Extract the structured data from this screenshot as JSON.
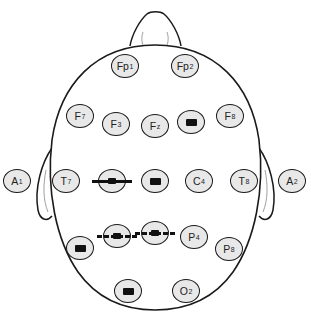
{
  "diagram": {
    "type": "eeg-10-20-electrode-map",
    "colors": {
      "outline": "#1a1a1a",
      "electrode_fill": "#e8e8e8",
      "redaction": "#111111"
    },
    "electrodes": [
      {
        "id": "Fp1",
        "base": "Fp",
        "sub": "1",
        "x": 125,
        "y": 66,
        "obscured": false
      },
      {
        "id": "Fp2",
        "base": "Fp",
        "sub": "2",
        "x": 185,
        "y": 66,
        "obscured": false
      },
      {
        "id": "F7",
        "base": "F",
        "sub": "7",
        "x": 80,
        "y": 116,
        "obscured": false
      },
      {
        "id": "F3",
        "base": "F",
        "sub": "3",
        "x": 116,
        "y": 124,
        "obscured": false
      },
      {
        "id": "Fz",
        "base": "F",
        "sub": "z",
        "x": 155,
        "y": 126,
        "obscured": false
      },
      {
        "id": "F4",
        "base": "",
        "sub": "",
        "x": 191,
        "y": 122,
        "obscured": true,
        "mark": "blob"
      },
      {
        "id": "F8",
        "base": "F",
        "sub": "8",
        "x": 230,
        "y": 116,
        "obscured": false
      },
      {
        "id": "A1",
        "base": "A",
        "sub": "1",
        "x": 17,
        "y": 181,
        "obscured": false
      },
      {
        "id": "T7",
        "base": "T",
        "sub": "7",
        "x": 66,
        "y": 181,
        "obscured": false
      },
      {
        "id": "C3",
        "base": "",
        "sub": "",
        "x": 112,
        "y": 181,
        "obscured": true,
        "mark": "strike"
      },
      {
        "id": "Cz",
        "base": "",
        "sub": "",
        "x": 155,
        "y": 181,
        "obscured": true,
        "mark": "blob"
      },
      {
        "id": "C4",
        "base": "C",
        "sub": "4",
        "x": 199,
        "y": 181,
        "obscured": false
      },
      {
        "id": "T8",
        "base": "T",
        "sub": "8",
        "x": 244,
        "y": 181,
        "obscured": false
      },
      {
        "id": "A2",
        "base": "A",
        "sub": "2",
        "x": 292,
        "y": 181,
        "obscured": false
      },
      {
        "id": "P7",
        "base": "",
        "sub": "",
        "x": 80,
        "y": 248,
        "obscured": true,
        "mark": "blob"
      },
      {
        "id": "P3",
        "base": "",
        "sub": "",
        "x": 117,
        "y": 236,
        "obscured": true,
        "mark": "dashed"
      },
      {
        "id": "Pz",
        "base": "",
        "sub": "",
        "x": 155,
        "y": 233,
        "obscured": true,
        "mark": "dashed"
      },
      {
        "id": "P4",
        "base": "P",
        "sub": "4",
        "x": 194,
        "y": 237,
        "obscured": false
      },
      {
        "id": "P8",
        "base": "P",
        "sub": "8",
        "x": 229,
        "y": 249,
        "obscured": false
      },
      {
        "id": "O1",
        "base": "",
        "sub": "",
        "x": 128,
        "y": 291,
        "obscured": true,
        "mark": "blob"
      },
      {
        "id": "O2",
        "base": "O",
        "sub": "2",
        "x": 186,
        "y": 291,
        "obscured": false
      }
    ]
  }
}
